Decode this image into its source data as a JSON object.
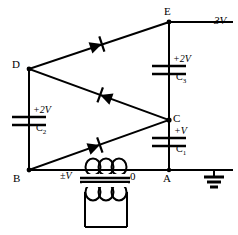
{
  "figure": {
    "kind": "circuit-schematic",
    "title_partial": "",
    "watermark": ""
  },
  "nodes": [
    {
      "id": "E",
      "label": "E",
      "x": 169,
      "y": 22
    },
    {
      "id": "D",
      "label": "D",
      "x": 19,
      "y": 69
    },
    {
      "id": "C",
      "label": "C",
      "x": 169,
      "y": 120
    },
    {
      "id": "B",
      "label": "B",
      "x": 19,
      "y": 170
    },
    {
      "id": "A",
      "label": "A",
      "x": 169,
      "y": 170
    },
    {
      "id": "0",
      "label": "0",
      "x": 122,
      "y": 170
    }
  ],
  "terminals": [
    {
      "name": "output-3v",
      "label": "3V",
      "x": 218,
      "y": 22
    }
  ],
  "capacitors": [
    {
      "name": "C3",
      "label": "C",
      "subscript": "3",
      "voltage": "+2V",
      "x": 169,
      "y": 70
    },
    {
      "name": "C1",
      "label": "C",
      "subscript": "1",
      "voltage": "+V",
      "x": 169,
      "y": 142
    },
    {
      "name": "C2",
      "label": "C",
      "subscript": "2",
      "voltage": "+2V",
      "x": 29,
      "y": 120
    }
  ],
  "diodes": [
    {
      "name": "diode-top",
      "from": "D",
      "to": "E",
      "orientation": "cathode-toward-E"
    },
    {
      "name": "diode-middle",
      "from": "D",
      "to": "C",
      "orientation": "cathode-toward-D"
    },
    {
      "name": "diode-bottom",
      "from": "B",
      "to": "C",
      "orientation": "cathode-toward-C"
    }
  ],
  "transformer": {
    "name": "transformer",
    "secondary_voltage": "±V",
    "secondary_label_x": 70,
    "secondary_label_y": 172
  },
  "ground": {
    "name": "earth-ground",
    "x": 214,
    "y": 172
  },
  "colors": {
    "wire": "#000000",
    "background": "#ffffff",
    "text": "#000000"
  }
}
